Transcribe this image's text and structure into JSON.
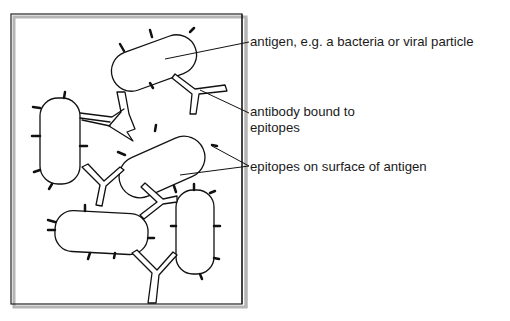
{
  "diagram": {
    "labels": {
      "antigen": "antigen, e.g. a bacteria or viral particle",
      "antibody_line1": "antibody bound to",
      "antibody_line2": "epitopes",
      "epitopes": "epitopes on surface of antigen"
    },
    "colors": {
      "stroke": "#111111",
      "frame_shadow": "#b5b5b5",
      "background": "#ffffff"
    }
  }
}
